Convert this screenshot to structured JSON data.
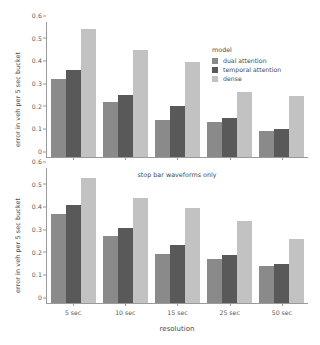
{
  "chart_data": [
    {
      "type": "bar",
      "panel": "top",
      "title": "",
      "xlabel": "",
      "ylabel": "error in veh per 5 sec bucket",
      "categories": [
        "5 sec",
        "10 sec",
        "15 sec",
        "25 sec",
        "50 sec"
      ],
      "ylim": [
        0,
        0.6
      ],
      "yticks": [
        "0",
        "0.1",
        "0.2",
        "0.3",
        "0.4",
        "0.5",
        "0.6"
      ],
      "ytick_values": [
        0,
        0.1,
        0.2,
        0.3,
        0.4,
        0.5,
        0.6
      ],
      "grid": false,
      "legend": {
        "title": "model",
        "position": "upper right inside",
        "entries": [
          "dual attention",
          "temporal attention",
          "dense"
        ]
      },
      "series": [
        {
          "name": "dual attention",
          "color": "#8a8a8a",
          "values": [
            0.348,
            0.245,
            0.166,
            0.156,
            0.115
          ]
        },
        {
          "name": "temporal attention",
          "color": "#595959",
          "values": [
            0.387,
            0.275,
            0.225,
            0.173,
            0.126
          ]
        },
        {
          "name": "dense",
          "color": "#c2c2c2",
          "values": [
            0.567,
            0.477,
            0.423,
            0.287,
            0.27
          ]
        }
      ]
    },
    {
      "type": "bar",
      "panel": "bottom",
      "title": "stop bar waveforms only",
      "xlabel": "resolution",
      "ylabel": "error in veh per 5 sec bucket",
      "categories": [
        "5 sec",
        "10 sec",
        "15 sec",
        "25 sec",
        "50 sec"
      ],
      "ylim": [
        0,
        0.6
      ],
      "yticks": [
        "0",
        "0.1",
        "0.2",
        "0.3",
        "0.4",
        "0.5",
        "0.6"
      ],
      "ytick_values": [
        0,
        0.1,
        0.2,
        0.3,
        0.4,
        0.5,
        0.6
      ],
      "grid": false,
      "series": [
        {
          "name": "dual attention",
          "color": "#8a8a8a",
          "values": [
            0.395,
            0.296,
            0.217,
            0.195,
            0.163
          ]
        },
        {
          "name": "temporal attention",
          "color": "#595959",
          "values": [
            0.437,
            0.334,
            0.256,
            0.215,
            0.173
          ]
        },
        {
          "name": "dense",
          "color": "#c2c2c2",
          "values": [
            0.557,
            0.466,
            0.424,
            0.363,
            0.283
          ]
        }
      ]
    }
  ]
}
